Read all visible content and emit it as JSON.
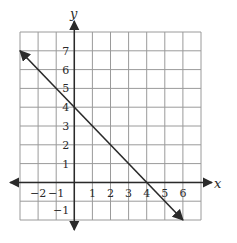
{
  "chart_data": {
    "type": "line",
    "title": "",
    "xlabel": "x",
    "ylabel": "y",
    "xlim": [
      -3,
      7
    ],
    "ylim": [
      -2,
      8
    ],
    "grid": true,
    "x_tick_labels": [
      "-2",
      "-1",
      "1",
      "2",
      "3",
      "4",
      "5",
      "6"
    ],
    "y_tick_labels": [
      "7",
      "6",
      "5",
      "4",
      "3",
      "2",
      "1",
      "-1"
    ],
    "series": [
      {
        "name": "line",
        "equation": "y = -x + 4",
        "points": [
          [
            -3,
            7
          ],
          [
            0,
            4
          ],
          [
            4,
            0
          ],
          [
            6,
            -2
          ]
        ],
        "arrows": "both ends"
      }
    ]
  },
  "labels": {
    "x_axis": "x",
    "y_axis": "y",
    "x_ticks": [
      {
        "v": -2,
        "t": "−2"
      },
      {
        "v": -1,
        "t": "−1"
      },
      {
        "v": 1,
        "t": "1"
      },
      {
        "v": 2,
        "t": "2"
      },
      {
        "v": 3,
        "t": "3"
      },
      {
        "v": 4,
        "t": "4"
      },
      {
        "v": 5,
        "t": "5"
      },
      {
        "v": 6,
        "t": "6"
      }
    ],
    "y_ticks": [
      {
        "v": 7,
        "t": "7"
      },
      {
        "v": 6,
        "t": "6"
      },
      {
        "v": 5,
        "t": "5"
      },
      {
        "v": 4,
        "t": "4"
      },
      {
        "v": 3,
        "t": "3"
      },
      {
        "v": 2,
        "t": "2"
      },
      {
        "v": 1,
        "t": "1"
      },
      {
        "v": -1,
        "t": "−1"
      }
    ]
  },
  "colors": {
    "grid": "#9a9a9a",
    "axis": "#2a2a2a",
    "line": "#2a2a2a"
  }
}
